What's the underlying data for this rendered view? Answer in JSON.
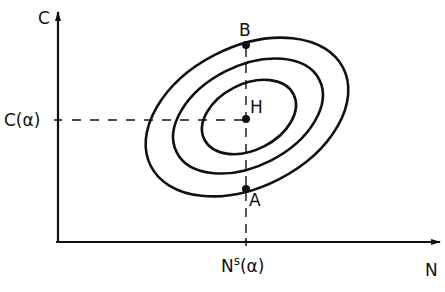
{
  "figure": {
    "axes": {
      "y_label": "C",
      "x_label": "N",
      "y_tick_label": "C(α)",
      "x_tick_label_main": "N",
      "x_tick_label_sup": "s",
      "x_tick_label_tail": "(α)"
    },
    "points": {
      "top": "B",
      "center": "H",
      "bottom": "A"
    },
    "contours": [
      {
        "name": "outer",
        "cx": 247,
        "cy": 117,
        "rx": 108,
        "ry": 70,
        "rotate": -27
      },
      {
        "name": "middle",
        "cx": 248,
        "cy": 116,
        "rx": 80,
        "ry": 50,
        "rotate": -27
      },
      {
        "name": "inner",
        "cx": 249,
        "cy": 117,
        "rx": 50,
        "ry": 33,
        "rotate": -27
      }
    ],
    "colors": {
      "ink": "#111111",
      "background": "#ffffff"
    }
  }
}
